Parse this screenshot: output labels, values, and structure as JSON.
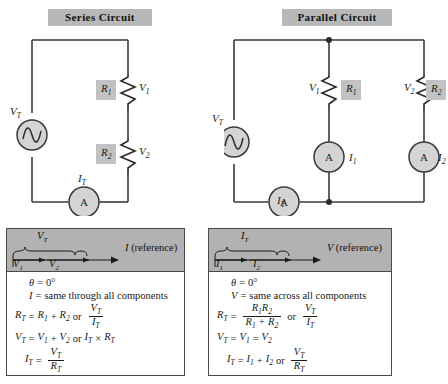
{
  "series": {
    "title": "Series Circuit",
    "source_label": "V_T",
    "resistor1_box": "R1",
    "resistor1_voltage": "V1",
    "resistor2_box": "R2",
    "resistor2_voltage": "V2",
    "ammeter_letter": "A",
    "ammeter_label": "I_T"
  },
  "parallel": {
    "title": "Parallel Circuit",
    "source_label": "V_T",
    "branch1_voltage": "V1",
    "branch1_box": "R1",
    "branch1_ammeter_letter": "A",
    "branch1_current": "I1",
    "branch2_voltage": "V2",
    "branch2_box": "R2",
    "branch2_ammeter_letter": "A",
    "branch2_current": "I2",
    "total_ammeter_letter": "A",
    "total_current": "I_T"
  },
  "series_panel": {
    "phasor": {
      "brace_label": "V_T",
      "vector1": "V1",
      "vector2": "V2",
      "reference_var": "I",
      "reference_word": "(reference)"
    },
    "lines": [
      {
        "id": "theta",
        "text": "θ = 0°"
      },
      {
        "id": "current-rule",
        "text": "I = same through all components"
      },
      {
        "id": "rt",
        "text": "RT = R1 + R2 or VT/IT"
      },
      {
        "id": "vt",
        "text": "VT = V1 + V2 or IT × RT"
      },
      {
        "id": "it",
        "text": "IT = VT/RT"
      }
    ]
  },
  "parallel_panel": {
    "phasor": {
      "brace_label": "I_T",
      "vector1": "I1",
      "vector2": "I2",
      "reference_var": "V",
      "reference_word": "(reference)"
    },
    "lines": [
      {
        "id": "theta",
        "text": "θ = 0°"
      },
      {
        "id": "voltage-rule",
        "text": "V = same across all components"
      },
      {
        "id": "rt",
        "text": "RT = R1R2/(R1 + R2) or VT/IT"
      },
      {
        "id": "vt",
        "text": "VT = V1 = V2"
      },
      {
        "id": "it",
        "text": "IT = I1 + I2 or VT/RT"
      }
    ]
  },
  "glyphs": {
    "theta": "θ",
    "equals": "=",
    "zero_deg": "0°",
    "plus": "+",
    "times": "×",
    "or": "or",
    "V": "V",
    "I": "I",
    "R": "R",
    "T": "T",
    "one": "1",
    "two": "2",
    "A": "A",
    "same_through": "same through all components",
    "same_across": "same across all components",
    "reference": "(reference)"
  },
  "colors": {
    "chip_gray": "#b8b8b8",
    "panel_head_gray": "#b2b2b2",
    "component_fill": "#d4d4d4",
    "wire": "#3a3a3a",
    "resistor_box": "#c2c2c2"
  }
}
